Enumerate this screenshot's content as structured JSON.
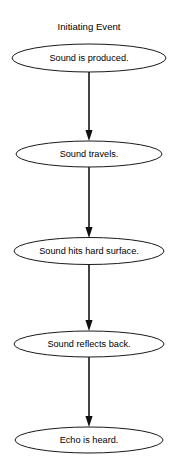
{
  "diagram": {
    "title": "Initiating Event",
    "type": "flowchart",
    "orientation": "vertical",
    "background_color": "#ffffff",
    "node_shape": "ellipse",
    "node_fill": "#ffffff",
    "node_stroke": "#1a1a1a",
    "connector_color": "#151515",
    "connector_style": "solid-line-with-filled-arrowhead",
    "nodes": [
      {
        "id": "node-1",
        "label": "Sound is produced.",
        "cx": 89,
        "cy": 58,
        "rx": 77,
        "ry": 14
      },
      {
        "id": "node-2",
        "label": "Sound travels.",
        "cx": 89,
        "cy": 154,
        "rx": 73,
        "ry": 13
      },
      {
        "id": "node-3",
        "label": "Sound hits hard surface.",
        "cx": 89,
        "cy": 251,
        "rx": 75,
        "ry": 13.5
      },
      {
        "id": "node-4",
        "label": "Sound reflects back.",
        "cx": 89,
        "cy": 344,
        "rx": 75,
        "ry": 13
      },
      {
        "id": "node-5",
        "label": "Echo is heard.",
        "cx": 89,
        "cy": 440,
        "rx": 74,
        "ry": 13
      }
    ],
    "edges": [
      {
        "id": "edge-1",
        "from": "node-1",
        "to": "node-2",
        "x": 89,
        "y1": 72,
        "y2": 141
      },
      {
        "id": "edge-2",
        "from": "node-2",
        "to": "node-3",
        "x": 89,
        "y1": 167,
        "y2": 238
      },
      {
        "id": "edge-3",
        "from": "node-3",
        "to": "node-4",
        "x": 89,
        "y1": 265,
        "y2": 331
      },
      {
        "id": "edge-4",
        "from": "node-4",
        "to": "node-5",
        "x": 89,
        "y1": 357,
        "y2": 427
      }
    ],
    "title_position": {
      "x": 89,
      "y": 27
    }
  }
}
